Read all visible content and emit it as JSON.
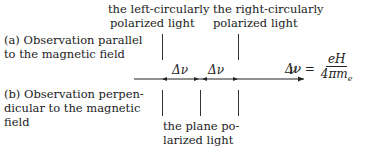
{
  "labels": {
    "left_circular": [
      "the left-circularly",
      "polarized light"
    ],
    "right_circular": [
      "the right-circularly",
      "polarized light"
    ],
    "case_a": [
      "(a) Observation parallel",
      "to the magnetic field"
    ],
    "case_b": [
      "(b) Observation perpen-",
      "dicular to the magnetic",
      "field"
    ],
    "plane_polarized": [
      "the plane po-",
      "larized light"
    ],
    "delta_nu_1": "Δν",
    "delta_nu_2": "Δν",
    "axis_label": "ν"
  },
  "formula": {
    "lhs": "Δν =",
    "numerator": "eH",
    "denominator": "4πm",
    "denominator_sub": "e"
  }
}
